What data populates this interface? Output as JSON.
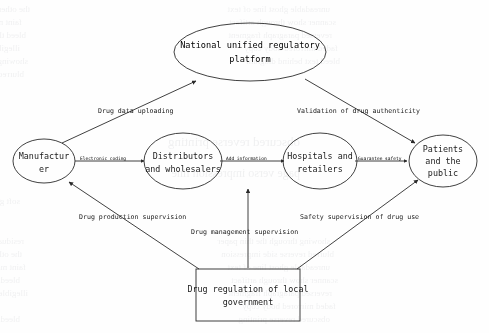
{
  "diagram": {
    "background_color": "#fefefe",
    "stroke_color": "#2b2b2b",
    "nodes": [
      {
        "id": "national-platform",
        "shape": "ellipse",
        "lines": [
          "National unified regulatory",
          "platform"
        ]
      },
      {
        "id": "manufacturer",
        "shape": "ellipse",
        "lines": [
          "Manufactur",
          "er"
        ]
      },
      {
        "id": "distributors",
        "shape": "ellipse",
        "lines": [
          "Distributors",
          "and wholesalers"
        ]
      },
      {
        "id": "hospitals",
        "shape": "ellipse",
        "lines": [
          "Hospitals and",
          "retailers"
        ]
      },
      {
        "id": "patients",
        "shape": "ellipse",
        "lines": [
          "Patients",
          "and the",
          "public"
        ]
      },
      {
        "id": "local-government",
        "shape": "rectangle",
        "lines": [
          "Drug regulation of local",
          "government"
        ]
      }
    ],
    "edges": [
      {
        "id": "manufacturer-to-platform",
        "from": "manufacturer",
        "to": "national-platform",
        "label": "Drug data uploading"
      },
      {
        "id": "platform-to-patients",
        "from": "national-platform",
        "to": "patients",
        "label": "Validation of drug authenticity"
      },
      {
        "id": "manufacturer-to-distributors",
        "from": "manufacturer",
        "to": "distributors",
        "label": "Electronic coding"
      },
      {
        "id": "distributors-to-hospitals",
        "from": "distributors",
        "to": "hospitals",
        "label": "Add information"
      },
      {
        "id": "hospitals-to-patients",
        "from": "hospitals",
        "to": "patients",
        "label": "Guarantee safety"
      },
      {
        "id": "government-to-manufacturer",
        "from": "local-government",
        "to": "manufacturer",
        "label": "Drug production supervision"
      },
      {
        "id": "government-to-distributors",
        "from": "local-government",
        "to": "distributors",
        "label": "Drug management supervision"
      },
      {
        "id": "government-to-patients",
        "from": "local-government",
        "to": "patients",
        "label": "Safety supervision of drug use"
      }
    ]
  },
  "ghost_text": {
    "note": "faint show-through text from reverse of scanned page (illegible)",
    "lines": [
      "the other side of the scanned page",
      "faint mirrored paragraph text here",
      "bleed through from printed sheet",
      "illegible reversed characters row",
      "showing through the thin paper",
      "blurred reverse side impression",
      "unreadable ghost line of text",
      "scanner show through artifact",
      "reversed paragraph fragment",
      "faded mirrored body copy",
      "bleed text behind diagram",
      "obscured reverse printing",
      "page verso impression line",
      "soft grey mirrored letters",
      "residual reverse side ink"
    ]
  }
}
